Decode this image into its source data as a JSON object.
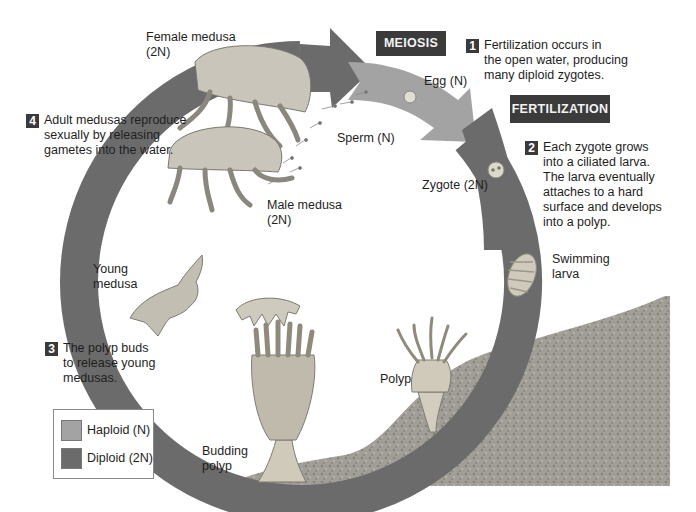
{
  "diagram": {
    "colors": {
      "haploid": "#a3a3a3",
      "diploid": "#6b6b6b",
      "badge_bg": "#3b3b3b",
      "rock": "#9c9a94"
    },
    "phase_badges": {
      "meiosis": "MEIOSIS",
      "fertilization": "FERTILIZATION"
    },
    "steps": [
      {
        "number": "1",
        "text": "Fertilization occurs in\nthe open water, producing\nmany diploid zygotes."
      },
      {
        "number": "2",
        "text": "Each zygote grows\ninto a ciliated larva.\nThe larva eventually\nattaches to a hard\nsurface and develops\ninto a polyp."
      },
      {
        "number": "3",
        "text": "The polyp buds\nto release young\nmedusas."
      },
      {
        "number": "4",
        "text": "Adult medusas reproduce\nsexually by releasing\ngametes into the water."
      }
    ],
    "labels": {
      "female_medusa": "Female medusa",
      "female_ploidy": "(2N)",
      "male_medusa": "Male medusa",
      "male_ploidy": "(2N)",
      "egg": "Egg (N)",
      "sperm": "Sperm (N)",
      "zygote": "Zygote (2N)",
      "swimming_larva_1": "Swimming",
      "swimming_larva_2": "larva",
      "polyp": "Polyp",
      "budding_polyp_1": "Budding",
      "budding_polyp_2": "polyp",
      "young_medusa_1": "Young",
      "young_medusa_2": "medusa"
    },
    "legend": {
      "items": [
        {
          "label": "Haploid (N)",
          "swatch": "#a3a3a3"
        },
        {
          "label": "Diploid (2N)",
          "swatch": "#6b6b6b"
        }
      ]
    }
  }
}
